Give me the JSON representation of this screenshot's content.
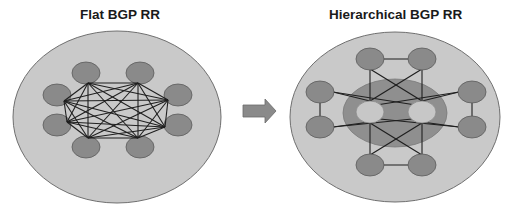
{
  "diagrams": [
    {
      "id": "flat",
      "title": "Flat BGP RR",
      "outer": {
        "cx": 117,
        "cy": 117,
        "rx": 104,
        "ry": 86
      },
      "nodes": [
        {
          "x": 86,
          "y": 73
        },
        {
          "x": 140,
          "y": 73
        },
        {
          "x": 178,
          "y": 95
        },
        {
          "x": 178,
          "y": 125
        },
        {
          "x": 140,
          "y": 147
        },
        {
          "x": 86,
          "y": 147
        },
        {
          "x": 57,
          "y": 125
        },
        {
          "x": 57,
          "y": 95
        }
      ],
      "anchors": [
        {
          "x": 88,
          "y": 83
        },
        {
          "x": 138,
          "y": 83
        },
        {
          "x": 168,
          "y": 100
        },
        {
          "x": 165,
          "y": 127
        },
        {
          "x": 138,
          "y": 138
        },
        {
          "x": 88,
          "y": 138
        },
        {
          "x": 67,
          "y": 122
        },
        {
          "x": 64,
          "y": 101
        }
      ],
      "topology": "full-mesh"
    },
    {
      "id": "hierarchical",
      "title": "Hierarchical BGP RR",
      "outer": {
        "cx": 395,
        "cy": 117,
        "rx": 105,
        "ry": 85
      },
      "inner": {
        "cx": 395,
        "cy": 113,
        "rx": 52,
        "ry": 34
      },
      "route_reflectors": [
        {
          "x": 370,
          "y": 112
        },
        {
          "x": 422,
          "y": 112
        }
      ],
      "clients": [
        {
          "x": 370,
          "y": 59
        },
        {
          "x": 422,
          "y": 59
        },
        {
          "x": 320,
          "y": 92
        },
        {
          "x": 320,
          "y": 127
        },
        {
          "x": 472,
          "y": 92
        },
        {
          "x": 472,
          "y": 127
        },
        {
          "x": 370,
          "y": 165
        },
        {
          "x": 422,
          "y": 165
        }
      ],
      "edges": [
        [
          370,
          59,
          422,
          59
        ],
        [
          370,
          165,
          422,
          165
        ],
        [
          320,
          92,
          320,
          127
        ],
        [
          472,
          92,
          472,
          127
        ],
        [
          370,
          69,
          370,
          101
        ],
        [
          422,
          69,
          422,
          101
        ],
        [
          370,
          69,
          422,
          101
        ],
        [
          422,
          69,
          370,
          101
        ],
        [
          370,
          155,
          370,
          123
        ],
        [
          422,
          155,
          422,
          123
        ],
        [
          370,
          155,
          422,
          123
        ],
        [
          422,
          155,
          370,
          123
        ],
        [
          333,
          92,
          370,
          101
        ],
        [
          333,
          92,
          422,
          106
        ],
        [
          459,
          92,
          422,
          101
        ],
        [
          459,
          92,
          370,
          106
        ],
        [
          333,
          127,
          422,
          118
        ],
        [
          333,
          127,
          370,
          122
        ],
        [
          459,
          127,
          370,
          118
        ],
        [
          459,
          127,
          422,
          122
        ]
      ]
    }
  ],
  "arrow": {
    "direction": "right",
    "label": ""
  },
  "colors": {
    "outer_fill": "#c9c9c9",
    "outer_stroke": "#6f6f6f",
    "inner_fill": "#8f8f8f",
    "node_fill": "#8a8a8a",
    "node_stroke": "#5a5a5a",
    "rr_fill": "#c7c7c7",
    "edge": "#1f1f1f",
    "arrow_fill": "#8a8a8a"
  }
}
